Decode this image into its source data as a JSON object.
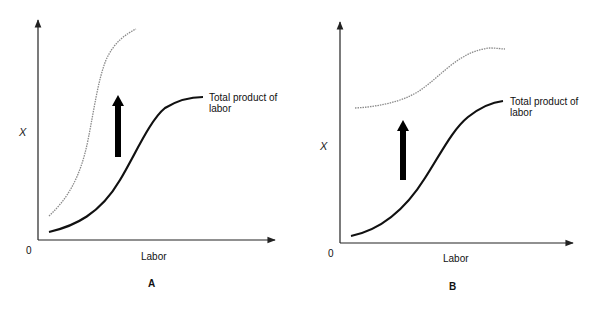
{
  "panels": [
    {
      "id": "A",
      "letter": "A",
      "y_axis_label": "X",
      "x_axis_label": "Labor",
      "origin_label": "0",
      "curve_label_line1": "Total product of",
      "curve_label_line2": "labor",
      "shift_direction": "up",
      "shifted_curve_style": "dotted-gray",
      "shift_type": "steeper curve (higher productivity at all labor levels, larger increase)"
    },
    {
      "id": "B",
      "letter": "B",
      "y_axis_label": "X",
      "x_axis_label": "Labor",
      "origin_label": "0",
      "curve_label_line1": "Total product of",
      "curve_label_line2": "labor",
      "shift_direction": "up",
      "shifted_curve_style": "dotted-gray",
      "shift_type": "parallel-ish upward shift (flatter shifted curve)"
    }
  ],
  "colors": {
    "solid_curve": "#111111",
    "dotted_curve": "#8a8a8a",
    "axis": "#222222",
    "arrow": "#000000"
  }
}
